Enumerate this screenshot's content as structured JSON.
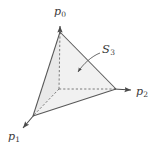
{
  "figure": {
    "kind": "geometric-diagram",
    "background_color": "#ffffff",
    "stroke_color": "#555555",
    "label_color": "#3a3a3a",
    "face_fill_front": "#f2f2f2",
    "face_fill_left": "#e8e8e8"
  },
  "labels": {
    "p0": {
      "base": "p",
      "sub": "0"
    },
    "p1": {
      "base": "p",
      "sub": "1"
    },
    "p2": {
      "base": "p",
      "sub": "2"
    },
    "s3": {
      "base": "S",
      "sub": "3"
    }
  },
  "axes": [
    {
      "name": "p0",
      "direction": "up",
      "tail": [
        59,
        89
      ],
      "head": [
        60,
        24
      ]
    },
    {
      "name": "p1",
      "direction": "down-left",
      "tail": [
        59,
        89
      ],
      "head": [
        21,
        130
      ]
    },
    {
      "name": "p2",
      "direction": "right",
      "tail": [
        59,
        89
      ],
      "head": [
        133,
        90
      ]
    }
  ],
  "vertices": [
    {
      "name": "origin",
      "x": 59,
      "y": 89,
      "hidden": true
    },
    {
      "name": "apex-p0",
      "x": 60,
      "y": 32,
      "hidden": false
    },
    {
      "name": "left-p1",
      "x": 33,
      "y": 116,
      "hidden": false
    },
    {
      "name": "right-p2",
      "x": 116,
      "y": 89,
      "hidden": false
    }
  ],
  "edges": [
    {
      "from": "apex-p0",
      "to": "left-p1",
      "style": "solid"
    },
    {
      "from": "apex-p0",
      "to": "right-p2",
      "style": "solid"
    },
    {
      "from": "left-p1",
      "to": "right-p2",
      "style": "solid"
    },
    {
      "from": "origin",
      "to": "apex-p0",
      "style": "dashed"
    },
    {
      "from": "origin",
      "to": "left-p1",
      "style": "dashed"
    },
    {
      "from": "origin",
      "to": "right-p2",
      "style": "dashed"
    }
  ],
  "leader": {
    "for": "s3",
    "from": [
      100,
      53
    ],
    "to": [
      77,
      73
    ],
    "style": "curved-arrow"
  }
}
